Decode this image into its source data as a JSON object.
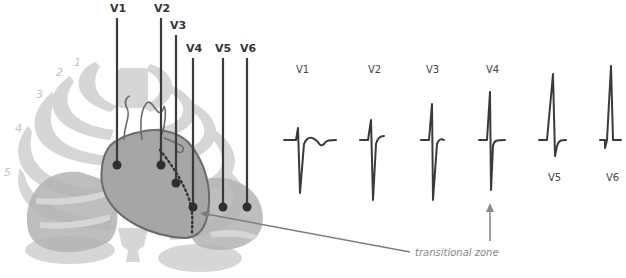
{
  "diagram": {
    "leads": [
      {
        "id": "V1",
        "label": "V1"
      },
      {
        "id": "V2",
        "label": "V2"
      },
      {
        "id": "V3",
        "label": "V3"
      },
      {
        "id": "V4",
        "label": "V4"
      },
      {
        "id": "V5",
        "label": "V5"
      },
      {
        "id": "V6",
        "label": "V6"
      }
    ],
    "ecg_complexes": [
      {
        "lead": "V1",
        "label": "V1"
      },
      {
        "lead": "V2",
        "label": "V2"
      },
      {
        "lead": "V3",
        "label": "V3"
      },
      {
        "lead": "V4",
        "label": "V4"
      },
      {
        "lead": "V5",
        "label": "V5"
      },
      {
        "lead": "V6",
        "label": "V6"
      }
    ],
    "rib_numbers": [
      "1",
      "2",
      "3",
      "4",
      "5"
    ],
    "annotation": "transitional zone",
    "colors": {
      "lead_line": "#3a3a3a",
      "ecg_trace": "#3a3a3a",
      "ribs": "#d3d3d3",
      "lungs": "#b5b5b5",
      "heart": "#a9a9a9",
      "heart_outline": "#6b6b6b",
      "arrow": "#8a8a8a"
    }
  }
}
